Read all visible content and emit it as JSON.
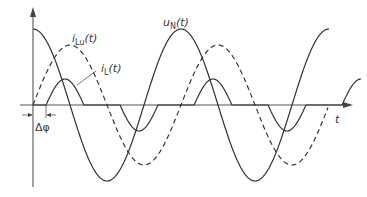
{
  "diagram": {
    "title": "",
    "axes": {
      "vertical": {
        "label": ""
      },
      "horizontal": {
        "label": "t"
      }
    },
    "labels": {
      "u_N": {
        "main": "u",
        "sub": "N",
        "arg": "(t)"
      },
      "i_Lu": {
        "main": "i",
        "sub": "Lu",
        "arg": "(t)"
      },
      "i_L": {
        "main": "i",
        "sub": "L",
        "arg": "(t)"
      },
      "delta_phi": "Δφ",
      "t_axis": "t"
    },
    "colors": {
      "line": "#333333",
      "axis": "#555555",
      "background": "#ffffff"
    },
    "curves": [
      {
        "name": "u_N(t)",
        "style": "solid",
        "description": "mains voltage, cosine starting at positive peak"
      },
      {
        "name": "i_Lu(t)",
        "style": "dashed",
        "description": "uncontrolled load current, lagging u_N by a quarter period"
      },
      {
        "name": "i_L(t)",
        "style": "solid",
        "description": "phase-controlled load current; zero until delay Δφ each half-cycle"
      }
    ]
  }
}
